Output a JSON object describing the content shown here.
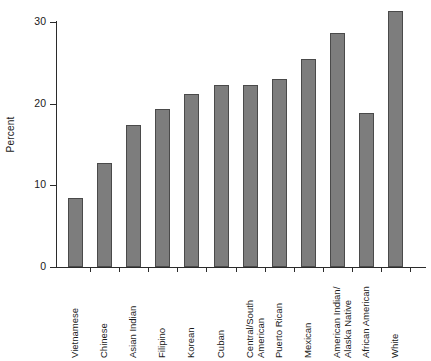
{
  "chart_data": {
    "type": "bar",
    "title": "",
    "xlabel": "",
    "ylabel": "Percent",
    "ylim": [
      0,
      30
    ],
    "yticks": [
      0,
      10,
      20,
      30
    ],
    "ytick_labels": [
      "0",
      "10",
      "20",
      "30"
    ],
    "grid": false,
    "legend": null,
    "bar_color": "#7d7d7d",
    "bar_edge_color": "#4a4a4a",
    "axis_color": "#2b2b2b",
    "categories": [
      "Vietnamese",
      "Chinese",
      "Asian Indian",
      "Filipino",
      "Korean",
      "Cuban",
      "Central/South American",
      "Puerto Rican",
      "Mexican",
      "American Indian/ Alaska Native",
      "African American",
      "White"
    ],
    "category_label_lines": [
      [
        "Vietnamese"
      ],
      [
        "Chinese"
      ],
      [
        "Asian Indian"
      ],
      [
        "Filipino"
      ],
      [
        "Korean"
      ],
      [
        "Cuban"
      ],
      [
        "Central/South",
        "American"
      ],
      [
        "Puerto Rican"
      ],
      [
        "Mexican"
      ],
      [
        "American Indian/",
        "Alaska Native"
      ],
      [
        "African American"
      ],
      [
        "White"
      ]
    ],
    "values": [
      8.5,
      12.7,
      17.4,
      19.3,
      21.2,
      22.3,
      22.3,
      23.0,
      25.5,
      28.7,
      18.8,
      31.3
    ]
  }
}
